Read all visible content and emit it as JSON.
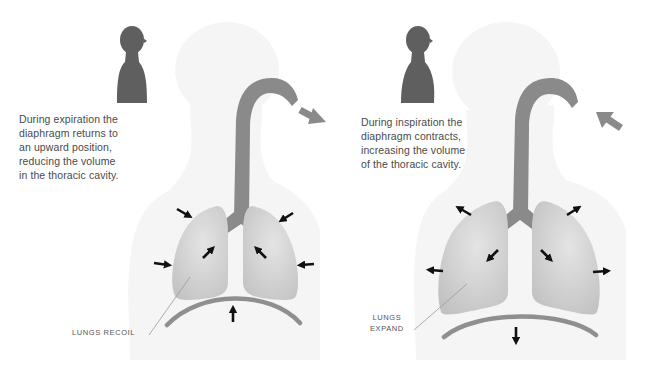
{
  "diagram": {
    "colors": {
      "silhouette_icon": "#5f5f5f",
      "body_background": "#f5f5f5",
      "airway": "#8a8a8a",
      "lung_fill": "#d6d6d6",
      "diaphragm": "#8f8f8f",
      "force_arrow": "#111111",
      "airflow_arrow": "#8a8a8a",
      "text": "#4a4a4a"
    },
    "expiration": {
      "caption_lines": [
        "During expiration the",
        "diaphragm returns to",
        "an upward position,",
        "reducing the volume",
        "in the thoracic cavity."
      ],
      "lung_label": "LUNGS RECOIL",
      "airflow_direction": "out",
      "lung_force_direction": "inward",
      "diaphragm_direction": "up"
    },
    "inspiration": {
      "caption_lines": [
        "During inspiration the",
        "diaphragm contracts,",
        "increasing the volume",
        "of the thoracic cavity."
      ],
      "lung_label_lines": [
        "LUNGS",
        "EXPAND"
      ],
      "airflow_direction": "in",
      "lung_force_direction": "outward",
      "diaphragm_direction": "down"
    }
  }
}
